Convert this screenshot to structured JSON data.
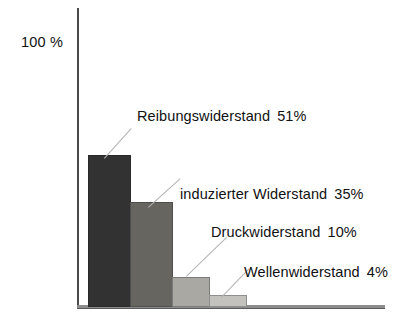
{
  "chart_data": {
    "type": "bar",
    "title": "",
    "subtitle": "",
    "xlabel": "",
    "ylabel": "100 %",
    "ylim": [
      0,
      100
    ],
    "grid": false,
    "legend_position": "inline-callouts",
    "categories": [
      "Reibungswiderstand",
      "induzierter Widerstand",
      "Druckwiderstand",
      "Wellenwiderstand"
    ],
    "values": [
      51,
      35,
      10,
      4
    ],
    "value_labels": [
      "51%",
      "35%",
      "10%",
      "4%"
    ],
    "annotations": [
      "Reibungswiderstand  51%",
      "induzierter Widerstand  35%",
      "Druckwiderstand  10%",
      "Wellenwiderstand  4%"
    ],
    "bar_colors": [
      "#333233",
      "#66655f",
      "#a9a8a3",
      "#c3c2bd"
    ]
  },
  "axis": {
    "y_top_label": "100 %"
  },
  "callouts": [
    {
      "name": "Reibungswiderstand",
      "percent": "51%"
    },
    {
      "name": "induzierter Widerstand",
      "percent": "35%"
    },
    {
      "name": "Druckwiderstand",
      "percent": "10%"
    },
    {
      "name": "Wellenwiderstand",
      "percent": "4%"
    }
  ]
}
